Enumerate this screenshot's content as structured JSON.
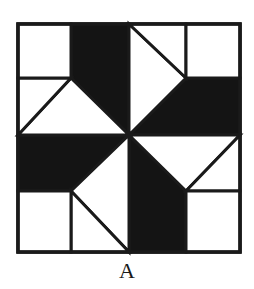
{
  "figure": {
    "type": "quilt-block pinwheel pattern",
    "caption": "A",
    "colors": {
      "dark": "#141414",
      "light": "#ffffff",
      "stroke": "#1a1a1a"
    },
    "grid": {
      "x": [
        18,
        71,
        129,
        186,
        240
      ],
      "y": [
        24,
        78,
        135,
        191,
        252
      ]
    }
  }
}
